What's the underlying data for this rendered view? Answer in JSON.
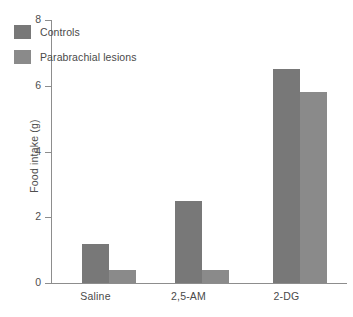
{
  "chart_data": {
    "type": "bar",
    "title": "",
    "xlabel": "",
    "ylabel": "Food intake (g)",
    "categories": [
      "Saline",
      "2,5-AM",
      "2-DG"
    ],
    "series": [
      {
        "name": "Controls",
        "values": [
          1.2,
          2.5,
          6.5
        ],
        "color": "#787878"
      },
      {
        "name": "Parabrachial lesions",
        "values": [
          0.4,
          0.4,
          5.8
        ],
        "color": "#8a8a8a"
      }
    ],
    "ylim": [
      0,
      8
    ],
    "yticks": [
      0,
      2,
      4,
      6,
      8
    ],
    "ytick_labels": [
      "0",
      "2",
      "4",
      "6",
      "8"
    ],
    "grid": false,
    "legend_position": "upper-left-inside",
    "background": "#ffffff",
    "axis_color": "#8d8d8d"
  },
  "axis": {
    "y_title": "Food intake (g)",
    "ticks": [
      {
        "value": 8,
        "label": "8"
      },
      {
        "value": 6,
        "label": "6"
      },
      {
        "value": 4,
        "label": "4"
      },
      {
        "value": 2,
        "label": "2"
      },
      {
        "value": 0,
        "label": "0"
      }
    ]
  },
  "legend": {
    "entries": [
      {
        "label": "Controls",
        "color": "#787878"
      },
      {
        "label": "Parabrachial lesions",
        "color": "#8a8a8a"
      }
    ]
  },
  "categories": [
    {
      "label": "Saline"
    },
    {
      "label": "2,5-AM"
    },
    {
      "label": "2-DG"
    }
  ]
}
